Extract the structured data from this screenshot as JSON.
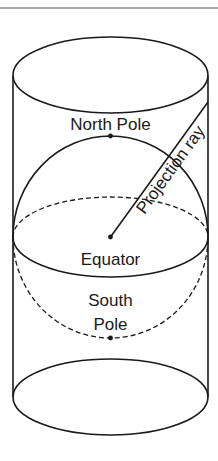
{
  "diagram": {
    "type": "cylindrical-projection",
    "labels": {
      "north_pole": "North Pole",
      "projection_ray": "Projection ray",
      "equator": "Equator",
      "south_pole_line1": "South",
      "south_pole_line2": "Pole"
    },
    "colors": {
      "stroke": "#1a1a1a",
      "background": "#ffffff"
    }
  }
}
